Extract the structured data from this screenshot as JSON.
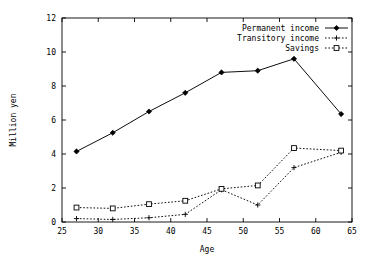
{
  "chart_data": {
    "type": "line",
    "title": "",
    "subtitle": "",
    "xlabel": "Age",
    "ylabel": "Million yen",
    "xlim": [
      25,
      65
    ],
    "ylim": [
      0,
      12
    ],
    "xticks": [
      25,
      30,
      35,
      40,
      45,
      50,
      55,
      60,
      65
    ],
    "xtick_labels": [
      "25",
      "30",
      "35",
      "40",
      "45",
      "50",
      "55",
      "60",
      "65"
    ],
    "yticks": [
      0,
      2,
      4,
      6,
      8,
      10,
      12
    ],
    "ytick_labels": [
      "0",
      "2",
      "4",
      "6",
      "8",
      "10",
      "12"
    ],
    "grid": false,
    "legend_position": "top-right",
    "x": [
      27,
      32,
      37,
      42,
      47,
      52,
      57,
      63.5
    ],
    "series": [
      {
        "name": "Permanent income",
        "marker": "filled-diamond",
        "linestyle": "solid",
        "color": "#000000",
        "values": [
          4.15,
          5.25,
          6.5,
          7.6,
          8.8,
          8.9,
          9.6,
          6.35
        ]
      },
      {
        "name": "Transitory income",
        "marker": "plus",
        "linestyle": "dotted",
        "color": "#000000",
        "values": [
          0.2,
          0.15,
          0.25,
          0.45,
          1.9,
          1.0,
          3.2,
          4.1
        ]
      },
      {
        "name": "Savings",
        "marker": "open-square",
        "linestyle": "dotted",
        "color": "#000000",
        "values": [
          0.85,
          0.8,
          1.05,
          1.25,
          1.95,
          2.15,
          4.35,
          4.2
        ]
      }
    ]
  },
  "legend": {
    "entries": [
      {
        "label": "Permanent income"
      },
      {
        "label": "Transitory income"
      },
      {
        "label": "Savings"
      }
    ]
  },
  "axes": {
    "x_title": "Age",
    "y_title": "Million yen"
  }
}
